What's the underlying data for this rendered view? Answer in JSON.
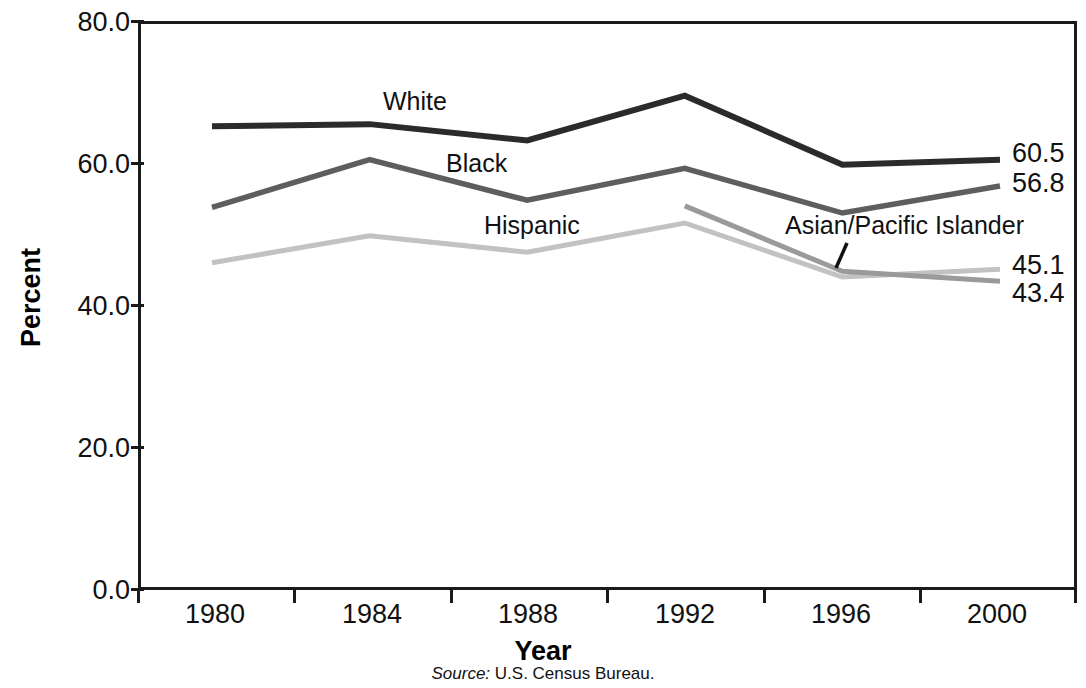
{
  "chart_data": {
    "type": "line",
    "title": "",
    "xlabel": "Year",
    "ylabel": "Percent",
    "categories": [
      "1980",
      "1984",
      "1988",
      "1992",
      "1996",
      "2000"
    ],
    "x": [
      1980,
      1984,
      1988,
      1992,
      1996,
      2000
    ],
    "ylim": [
      0.0,
      80.0
    ],
    "yticks": [
      "0.0",
      "20.0",
      "40.0",
      "60.0",
      "80.0"
    ],
    "ytick_values": [
      0.0,
      20.0,
      40.0,
      60.0,
      80.0
    ],
    "grid": false,
    "legend_position": "inline-labels",
    "series": [
      {
        "name": "White",
        "color": "#2b2b2b",
        "values": [
          65.2,
          65.5,
          63.2,
          69.5,
          59.8,
          60.5
        ],
        "end_label": "60.5"
      },
      {
        "name": "Black",
        "color": "#5e5e5e",
        "values": [
          53.8,
          60.5,
          54.8,
          59.3,
          53.0,
          56.8
        ],
        "end_label": "56.8"
      },
      {
        "name": "Hispanic",
        "color": "#c2c2c2",
        "values": [
          46.0,
          49.8,
          47.5,
          51.6,
          44.0,
          45.1
        ],
        "end_label": "45.1"
      },
      {
        "name": "Asian/Pacific Islander",
        "color": "#9a9a9a",
        "values": [
          null,
          null,
          null,
          54.0,
          44.8,
          43.4
        ],
        "end_label": "43.4"
      }
    ],
    "annotations": [
      {
        "text": "White",
        "series": "White"
      },
      {
        "text": "Black",
        "series": "Black"
      },
      {
        "text": "Hispanic",
        "series": "Hispanic"
      },
      {
        "text": "Asian/Pacific Islander",
        "series": "Asian/Pacific Islander",
        "has_leader_line": true
      }
    ],
    "source": {
      "label": "Source:",
      "text": "U.S. Census Bureau."
    }
  },
  "axes": {
    "y_title": "Percent",
    "x_title": "Year",
    "y_tick_0": "0.0",
    "y_tick_1": "20.0",
    "y_tick_2": "40.0",
    "y_tick_3": "60.0",
    "y_tick_4": "80.0",
    "x_tick_0": "1980",
    "x_tick_1": "1984",
    "x_tick_2": "1988",
    "x_tick_3": "1992",
    "x_tick_4": "1996",
    "x_tick_5": "2000"
  },
  "series_labels": {
    "white": "White",
    "black": "Black",
    "hispanic": "Hispanic",
    "asian_pacific_islander": "Asian/Pacific Islander"
  },
  "value_labels": {
    "white": "60.5",
    "black": "56.8",
    "hispanic": "45.1",
    "asian_pacific_islander": "43.4"
  },
  "source": {
    "label": "Source:",
    "text": "U.S. Census Bureau."
  },
  "colors": {
    "white_series": "#2b2b2b",
    "black_series": "#5e5e5e",
    "hispanic_series": "#c2c2c2",
    "api_series": "#9a9a9a",
    "axis": "#1a1a1a",
    "text": "#111111",
    "background": "#ffffff"
  }
}
